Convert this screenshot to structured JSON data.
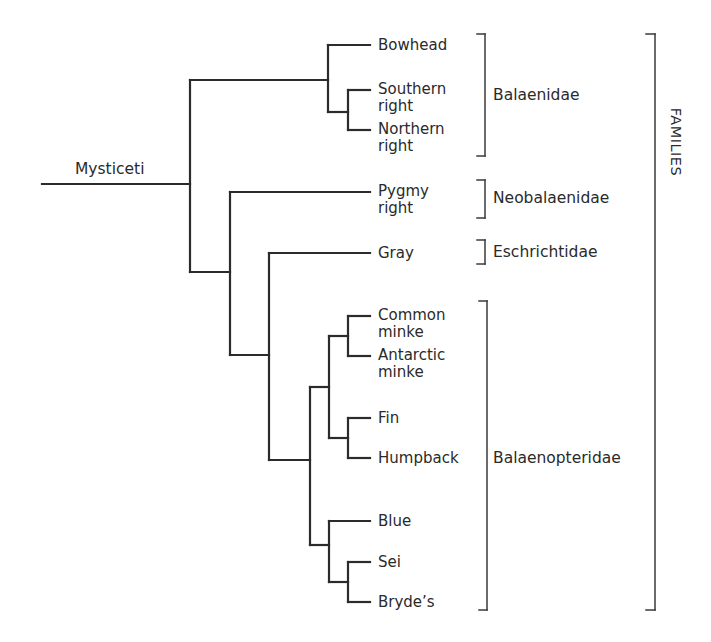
{
  "diagram": {
    "type": "phylogenetic-tree",
    "root": "Mysticeti",
    "group_label": "FAMILIES",
    "leaves": [
      {
        "name": "Bowhead",
        "lines": [
          "Bowhead"
        ],
        "family": "Balaenidae"
      },
      {
        "name": "Southern right",
        "lines": [
          "Southern",
          "right"
        ],
        "family": "Balaenidae"
      },
      {
        "name": "Northern right",
        "lines": [
          "Northern",
          "right"
        ],
        "family": "Balaenidae"
      },
      {
        "name": "Pygmy right",
        "lines": [
          "Pygmy",
          "right"
        ],
        "family": "Neobalaenidae"
      },
      {
        "name": "Gray",
        "lines": [
          "Gray"
        ],
        "family": "Eschrichtidae"
      },
      {
        "name": "Common minke",
        "lines": [
          "Common",
          "minke"
        ],
        "family": "Balaenopteridae"
      },
      {
        "name": "Antarctic minke",
        "lines": [
          "Antarctic",
          "minke"
        ],
        "family": "Balaenopteridae"
      },
      {
        "name": "Fin",
        "lines": [
          "Fin"
        ],
        "family": "Balaenopteridae"
      },
      {
        "name": "Humpback",
        "lines": [
          "Humpback"
        ],
        "family": "Balaenopteridae"
      },
      {
        "name": "Blue",
        "lines": [
          "Blue"
        ],
        "family": "Balaenopteridae"
      },
      {
        "name": "Sei",
        "lines": [
          "Sei"
        ],
        "family": "Balaenopteridae"
      },
      {
        "name": "Bryde's",
        "lines": [
          "Bryde’s"
        ],
        "family": "Balaenopteridae"
      }
    ],
    "families": [
      {
        "name": "Balaenidae",
        "members": [
          "Bowhead",
          "Southern right",
          "Northern right"
        ]
      },
      {
        "name": "Neobalaenidae",
        "members": [
          "Pygmy right"
        ]
      },
      {
        "name": "Eschrichtidae",
        "members": [
          "Gray"
        ]
      },
      {
        "name": "Balaenopteridae",
        "members": [
          "Common minke",
          "Antarctic minke",
          "Fin",
          "Humpback",
          "Blue",
          "Sei",
          "Bryde's"
        ]
      }
    ],
    "newick": "(((Bowhead,(Southern right,Northern right)),(Pygmy right,(Gray,(((Common minke,Antarctic minke),(Fin,Humpback)),(Blue,(Sei,Bryde's)))))))Mysticeti;"
  },
  "labels": {
    "root": "Mysticeti",
    "families_axis": "FAMILIES",
    "leaf_bowhead": "Bowhead",
    "leaf_southern_1": "Southern",
    "leaf_southern_2": "right",
    "leaf_northern_1": "Northern",
    "leaf_northern_2": "right",
    "leaf_pygmy_1": "Pygmy",
    "leaf_pygmy_2": "right",
    "leaf_gray": "Gray",
    "leaf_common_1": "Common",
    "leaf_common_2": "minke",
    "leaf_antarctic_1": "Antarctic",
    "leaf_antarctic_2": "minke",
    "leaf_fin": "Fin",
    "leaf_humpback": "Humpback",
    "leaf_blue": "Blue",
    "leaf_sei": "Sei",
    "leaf_brydes": "Bryde’s",
    "family_balaenidae": "Balaenidae",
    "family_neobalaenidae": "Neobalaenidae",
    "family_eschrichtidae": "Eschrichtidae",
    "family_balaenopteridae": "Balaenopteridae"
  },
  "colors": {
    "line": "#2b2b2b",
    "text": "#2a2a2a",
    "background": "#ffffff"
  }
}
